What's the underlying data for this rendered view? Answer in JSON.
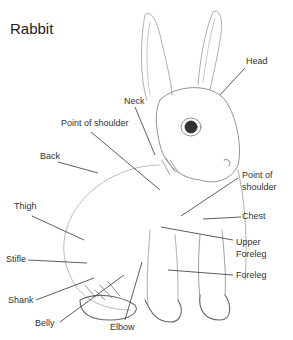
{
  "title": "Rabbit",
  "labels": {
    "head": "Head",
    "neck": "Neck",
    "point_of_shoulder_left": "Point of shoulder",
    "back": "Back",
    "thigh": "Thigh",
    "stifle": "Stifle",
    "shank": "Shank",
    "belly": "Belly",
    "elbow": "Elbow",
    "point_of_shoulder_right_1": "Point of",
    "point_of_shoulder_right_2": "shoulder",
    "chest": "Chest",
    "upper_foreleg_1": "Upper",
    "upper_foreleg_2": "Foreleg",
    "foreleg": "Foreleg"
  },
  "colors": {
    "text": "#333333",
    "line": "#333333",
    "sketch": "#8a8a8a"
  }
}
